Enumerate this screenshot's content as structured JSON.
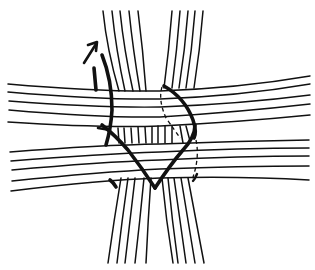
{
  "diagram": {
    "subject": "woven-strand-crossing",
    "colors": {
      "ink": "#111111",
      "background": "#ffffff"
    },
    "vertical_groups": [
      {
        "name": "left-vertical-strands",
        "count": 5
      },
      {
        "name": "right-vertical-strands",
        "count": 5
      }
    ],
    "horizontal_groups": [
      {
        "name": "upper-horizontal-strands",
        "count": 5
      },
      {
        "name": "lower-horizontal-strands",
        "count": 5
      }
    ],
    "binding": {
      "name": "v-shaped-binding-strand",
      "style": "thick"
    },
    "arrow": {
      "name": "upward-arrow",
      "direction": "up-right"
    }
  }
}
